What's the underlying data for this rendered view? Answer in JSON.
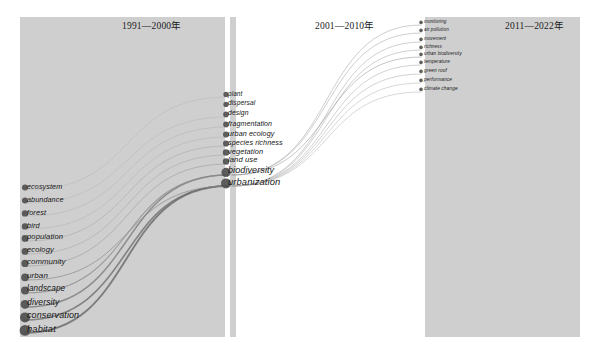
{
  "figure": {
    "type": "alluvial-keyword-evolution",
    "background": "#ffffff",
    "panel_fill": "#cfcfcf",
    "node_color": "#4d4d4d"
  },
  "panels": [
    {
      "id": "p1",
      "title": "1991—2000年",
      "x": 20,
      "y": 17,
      "w": 205,
      "h": 320,
      "title_x": 122,
      "title_y": 18
    },
    {
      "id": "p2",
      "title": "2001—2010年",
      "x": 230,
      "y": 17,
      "w": 6,
      "h": 320,
      "title_x": 315,
      "title_y": 18
    },
    {
      "id": "p3",
      "title": "2011—2022年",
      "x": 425,
      "y": 17,
      "w": 155,
      "h": 320,
      "title_x": 505,
      "title_y": 18
    }
  ],
  "columns": [
    {
      "id": "col-1991-2000",
      "period": "1991—2000年",
      "label_x": 27,
      "nodes": [
        {
          "label": "ecosystem",
          "y": 190,
          "size": 3.0,
          "font": 7.2
        },
        {
          "label": "abundance",
          "y": 203,
          "size": 3.0,
          "font": 7.2
        },
        {
          "label": "forest",
          "y": 216,
          "size": 3.2,
          "font": 7.4
        },
        {
          "label": "bird",
          "y": 229,
          "size": 3.2,
          "font": 7.4
        },
        {
          "label": "population",
          "y": 241,
          "size": 3.4,
          "font": 7.6
        },
        {
          "label": "ecology",
          "y": 254,
          "size": 3.4,
          "font": 7.6
        },
        {
          "label": "community",
          "y": 266,
          "size": 3.6,
          "font": 7.8
        },
        {
          "label": "urban",
          "y": 280,
          "size": 3.8,
          "font": 8.0
        },
        {
          "label": "landscape",
          "y": 293,
          "size": 4.0,
          "font": 8.2
        },
        {
          "label": "diversity",
          "y": 307,
          "size": 4.4,
          "font": 8.6
        },
        {
          "label": "conservation",
          "y": 320,
          "size": 5.0,
          "font": 9.0
        },
        {
          "label": "habitat",
          "y": 333,
          "size": 5.4,
          "font": 9.4
        }
      ]
    },
    {
      "id": "col-2001-2010",
      "period": "2001—2010年",
      "label_x": 228,
      "nodes": [
        {
          "label": "plant",
          "y": 97,
          "size": 2.6,
          "font": 6.4
        },
        {
          "label": "dispersal",
          "y": 107,
          "size": 2.6,
          "font": 6.6
        },
        {
          "label": "design",
          "y": 117,
          "size": 2.8,
          "font": 6.8
        },
        {
          "label": "fragmentation",
          "y": 127,
          "size": 2.8,
          "font": 7.0
        },
        {
          "label": "urban ecology",
          "y": 137,
          "size": 3.0,
          "font": 7.2
        },
        {
          "label": "species richness",
          "y": 146,
          "size": 3.0,
          "font": 7.2
        },
        {
          "label": "vegetation",
          "y": 155,
          "size": 3.2,
          "font": 7.4
        },
        {
          "label": "land use",
          "y": 164,
          "size": 3.2,
          "font": 7.6
        },
        {
          "label": "biodiversity",
          "y": 175,
          "size": 4.6,
          "font": 9.0
        },
        {
          "label": "urbanization",
          "y": 186,
          "size": 5.0,
          "font": 9.4
        }
      ]
    },
    {
      "id": "col-2011-2022",
      "period": "2011—2022年",
      "label_x": 424,
      "nodes": [
        {
          "label": "urban biodiversity",
          "y": 57,
          "size": 1.8,
          "font": 4.6
        },
        {
          "label": "monitoring",
          "y": 25,
          "size": 1.8,
          "font": 4.6
        },
        {
          "label": "air pollution",
          "y": 33,
          "size": 1.8,
          "font": 4.6
        },
        {
          "label": "movement",
          "y": 42,
          "size": 1.8,
          "font": 4.6
        },
        {
          "label": "richness",
          "y": 50,
          "size": 1.8,
          "font": 4.6
        },
        {
          "label": "temperature",
          "y": 65,
          "size": 1.8,
          "font": 4.6
        },
        {
          "label": "green roof",
          "y": 74,
          "size": 1.8,
          "font": 4.8
        },
        {
          "label": "performance",
          "y": 83,
          "size": 1.8,
          "font": 4.8
        },
        {
          "label": "climate change",
          "y": 92,
          "size": 1.8,
          "font": 4.8
        }
      ]
    }
  ],
  "flows": [
    {
      "from": "habitat",
      "to": "urbanization",
      "x1": 24,
      "y1": 333,
      "x2": 228,
      "y2": 186,
      "width": 1.9,
      "color": "#6e6e6e",
      "opacity": 0.85
    },
    {
      "from": "conservation",
      "to": "urbanization",
      "x1": 24,
      "y1": 320,
      "x2": 228,
      "y2": 186,
      "width": 1.6,
      "color": "#6e6e6e",
      "opacity": 0.8
    },
    {
      "from": "diversity",
      "to": "biodiversity",
      "x1": 25,
      "y1": 307,
      "x2": 228,
      "y2": 175,
      "width": 1.4,
      "color": "#7a7a7a",
      "opacity": 0.8
    },
    {
      "from": "landscape",
      "to": "biodiversity",
      "x1": 26,
      "y1": 293,
      "x2": 228,
      "y2": 175,
      "width": 1.1,
      "color": "#8a8a8a",
      "opacity": 0.75
    },
    {
      "from": "urban",
      "to": "urbanization",
      "x1": 27,
      "y1": 280,
      "x2": 228,
      "y2": 186,
      "width": 1.0,
      "color": "#8a8a8a",
      "opacity": 0.7
    },
    {
      "from": "community",
      "to": "land use",
      "x1": 27,
      "y1": 266,
      "x2": 228,
      "y2": 164,
      "width": 0.8,
      "color": "#989898",
      "opacity": 0.7
    },
    {
      "from": "ecology",
      "to": "vegetation",
      "x1": 27,
      "y1": 254,
      "x2": 228,
      "y2": 155,
      "width": 0.7,
      "color": "#9e9e9e",
      "opacity": 0.65
    },
    {
      "from": "population",
      "to": "species richness",
      "x1": 27,
      "y1": 241,
      "x2": 228,
      "y2": 146,
      "width": 0.7,
      "color": "#9e9e9e",
      "opacity": 0.65
    },
    {
      "from": "bird",
      "to": "urban ecology",
      "x1": 27,
      "y1": 229,
      "x2": 228,
      "y2": 137,
      "width": 0.6,
      "color": "#a6a6a6",
      "opacity": 0.6
    },
    {
      "from": "forest",
      "to": "fragmentation",
      "x1": 27,
      "y1": 216,
      "x2": 228,
      "y2": 127,
      "width": 0.6,
      "color": "#a6a6a6",
      "opacity": 0.6
    },
    {
      "from": "abundance",
      "to": "design",
      "x1": 27,
      "y1": 203,
      "x2": 228,
      "y2": 117,
      "width": 0.6,
      "color": "#ababab",
      "opacity": 0.6
    },
    {
      "from": "ecosystem",
      "to": "plant",
      "x1": 27,
      "y1": 190,
      "x2": 228,
      "y2": 97,
      "width": 0.6,
      "color": "#ababab",
      "opacity": 0.6
    },
    {
      "from": "biodiversity",
      "to": "monitoring",
      "x1": 232,
      "y1": 175,
      "x2": 421,
      "y2": 25,
      "width": 0.7,
      "color": "#9b9b9b",
      "opacity": 0.7
    },
    {
      "from": "biodiversity",
      "to": "air pollution",
      "x1": 232,
      "y1": 175,
      "x2": 421,
      "y2": 33,
      "width": 0.7,
      "color": "#9b9b9b",
      "opacity": 0.7
    },
    {
      "from": "urbanization",
      "to": "movement",
      "x1": 232,
      "y1": 186,
      "x2": 421,
      "y2": 42,
      "width": 0.7,
      "color": "#a0a0a0",
      "opacity": 0.7
    },
    {
      "from": "urbanization",
      "to": "richness",
      "x1": 232,
      "y1": 186,
      "x2": 421,
      "y2": 50,
      "width": 0.7,
      "color": "#a0a0a0",
      "opacity": 0.7
    },
    {
      "from": "biodiversity",
      "to": "urban biodiversity",
      "x1": 232,
      "y1": 175,
      "x2": 421,
      "y2": 57,
      "width": 0.8,
      "color": "#979797",
      "opacity": 0.7
    },
    {
      "from": "urbanization",
      "to": "temperature",
      "x1": 232,
      "y1": 186,
      "x2": 421,
      "y2": 65,
      "width": 0.7,
      "color": "#a3a3a3",
      "opacity": 0.7
    },
    {
      "from": "urbanization",
      "to": "green roof",
      "x1": 232,
      "y1": 186,
      "x2": 421,
      "y2": 74,
      "width": 0.7,
      "color": "#a3a3a3",
      "opacity": 0.7
    },
    {
      "from": "urbanization",
      "to": "performance",
      "x1": 232,
      "y1": 186,
      "x2": 421,
      "y2": 83,
      "width": 0.7,
      "color": "#a8a8a8",
      "opacity": 0.65
    },
    {
      "from": "urbanization",
      "to": "climate change",
      "x1": 232,
      "y1": 186,
      "x2": 421,
      "y2": 92,
      "width": 0.7,
      "color": "#a8a8a8",
      "opacity": 0.65
    }
  ],
  "chart_data": {
    "type": "alluvial",
    "title": "",
    "periods": [
      "1991—2000年",
      "2001—2010年",
      "2011—2022年"
    ],
    "stages": [
      {
        "period": "1991—2000年",
        "keywords": [
          "ecosystem",
          "abundance",
          "forest",
          "bird",
          "population",
          "ecology",
          "community",
          "urban",
          "landscape",
          "diversity",
          "conservation",
          "habitat"
        ]
      },
      {
        "period": "2001—2010年",
        "keywords": [
          "plant",
          "dispersal",
          "design",
          "fragmentation",
          "urban ecology",
          "species richness",
          "vegetation",
          "land use",
          "biodiversity",
          "urbanization"
        ]
      },
      {
        "period": "2011—2022年",
        "keywords": [
          "monitoring",
          "air pollution",
          "movement",
          "richness",
          "urban biodiversity",
          "temperature",
          "green roof",
          "performance",
          "climate change"
        ]
      }
    ],
    "links": [
      [
        "habitat",
        "urbanization"
      ],
      [
        "conservation",
        "urbanization"
      ],
      [
        "diversity",
        "biodiversity"
      ],
      [
        "landscape",
        "biodiversity"
      ],
      [
        "urban",
        "urbanization"
      ],
      [
        "community",
        "land use"
      ],
      [
        "ecology",
        "vegetation"
      ],
      [
        "population",
        "species richness"
      ],
      [
        "bird",
        "urban ecology"
      ],
      [
        "forest",
        "fragmentation"
      ],
      [
        "abundance",
        "design"
      ],
      [
        "ecosystem",
        "plant"
      ],
      [
        "biodiversity",
        "monitoring"
      ],
      [
        "biodiversity",
        "air pollution"
      ],
      [
        "urbanization",
        "movement"
      ],
      [
        "urbanization",
        "richness"
      ],
      [
        "biodiversity",
        "urban biodiversity"
      ],
      [
        "urbanization",
        "temperature"
      ],
      [
        "urbanization",
        "green roof"
      ],
      [
        "urbanization",
        "performance"
      ],
      [
        "urbanization",
        "climate change"
      ]
    ],
    "xlabel": "",
    "ylabel": "",
    "legend": []
  }
}
